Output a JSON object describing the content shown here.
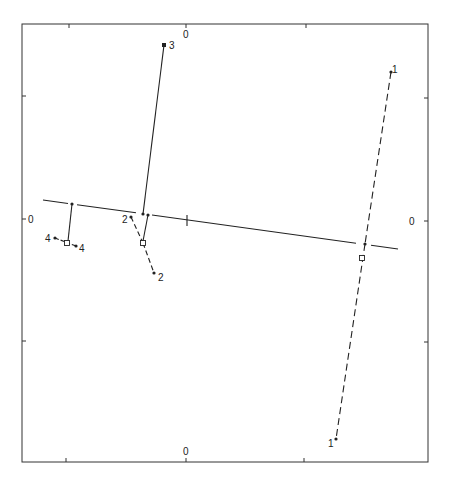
{
  "diagram": {
    "type": "biplot / projection diagram",
    "frame": {
      "left": 22,
      "top": 24,
      "right": 428,
      "bottom": 462
    },
    "axis_labels": {
      "top_zero": "0",
      "bottom_zero": "0",
      "left_zero": "0",
      "right_zero": "0"
    },
    "ticks": {
      "top_x": [
        69,
        186,
        306
      ],
      "bottom_x": [
        66,
        186,
        304
      ],
      "left_y": [
        96,
        219,
        341
      ],
      "right_y": [
        98,
        221,
        342
      ]
    },
    "reference_line": {
      "x1": 43,
      "y1": 200,
      "x2": 398,
      "y2": 249,
      "tick_at": [
        187,
        220
      ]
    },
    "groups": [
      {
        "id": "1",
        "style": "dashed",
        "points": [
          {
            "label": "1",
            "x": 391,
            "y": 72
          },
          {
            "label": "1",
            "x": 336,
            "y": 439
          }
        ],
        "line_point": {
          "x": 365,
          "y": 244
        },
        "projection": {
          "x": 362,
          "y": 258
        }
      },
      {
        "id": "2",
        "style": "dashed",
        "points": [
          {
            "label": "2",
            "x": 131,
            "y": 217
          },
          {
            "label": "2",
            "x": 154,
            "y": 273
          }
        ],
        "line_point": {
          "x": 148,
          "y": 215
        },
        "projection": {
          "x": 143,
          "y": 243
        }
      },
      {
        "id": "3",
        "style": "solid",
        "points": [
          {
            "label": "3",
            "x": 164,
            "y": 45
          }
        ],
        "line_point": {
          "x": 143,
          "y": 214
        }
      },
      {
        "id": "4",
        "style": "dashdot",
        "points": [
          {
            "label": "4",
            "x": 55,
            "y": 238
          },
          {
            "label": "4",
            "x": 76,
            "y": 246
          }
        ],
        "line_point": {
          "x": 72,
          "y": 204
        },
        "projection": {
          "x": 67,
          "y": 243
        }
      }
    ],
    "colors": {
      "ink": "#222222",
      "background": "#ffffff"
    }
  }
}
